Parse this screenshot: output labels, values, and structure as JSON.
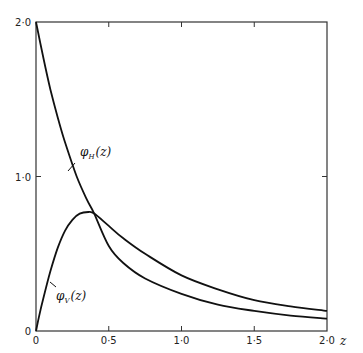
{
  "chart_data": {
    "type": "line",
    "title": "",
    "xlabel": "z",
    "ylabel": "",
    "xlim": [
      0,
      2.0
    ],
    "ylim": [
      0,
      2.0
    ],
    "grid": false,
    "legend_position": "inline labels",
    "x_ticks": [
      0,
      0.5,
      1.0,
      1.5,
      2.0
    ],
    "x_tick_labels": [
      "0",
      "0·5",
      "1·0",
      "1·5",
      "2·0"
    ],
    "y_ticks": [
      0,
      1.0,
      2.0
    ],
    "y_tick_labels": [
      "0",
      "1·0",
      "2·0"
    ],
    "series": [
      {
        "name": "φH(z)",
        "label_main": "φ",
        "label_sub": "H",
        "label_arg": "(z)",
        "x": [
          0,
          0.05,
          0.1,
          0.15,
          0.2,
          0.28,
          0.35,
          0.4,
          0.5,
          0.6,
          0.75,
          1.0,
          1.25,
          1.5,
          1.75,
          2.0
        ],
        "y": [
          2.0,
          1.77,
          1.56,
          1.38,
          1.22,
          1.0,
          0.85,
          0.76,
          0.55,
          0.44,
          0.34,
          0.24,
          0.17,
          0.13,
          0.1,
          0.08
        ]
      },
      {
        "name": "φV(z)",
        "label_main": "φ",
        "label_sub": "V",
        "label_arg": "(z)",
        "x": [
          0,
          0.02,
          0.05,
          0.1,
          0.15,
          0.2,
          0.25,
          0.3,
          0.36,
          0.4,
          0.5,
          0.6,
          0.75,
          1.0,
          1.25,
          1.5,
          1.75,
          2.0
        ],
        "y": [
          0,
          0.09,
          0.21,
          0.39,
          0.54,
          0.65,
          0.72,
          0.76,
          0.77,
          0.76,
          0.68,
          0.6,
          0.5,
          0.36,
          0.27,
          0.2,
          0.16,
          0.13
        ]
      }
    ],
    "annotations": [
      {
        "text": "φH(z)",
        "at": [
          0.33,
          1.2
        ]
      },
      {
        "text": "φV(z)",
        "at": [
          0.12,
          0.22
        ]
      }
    ]
  }
}
